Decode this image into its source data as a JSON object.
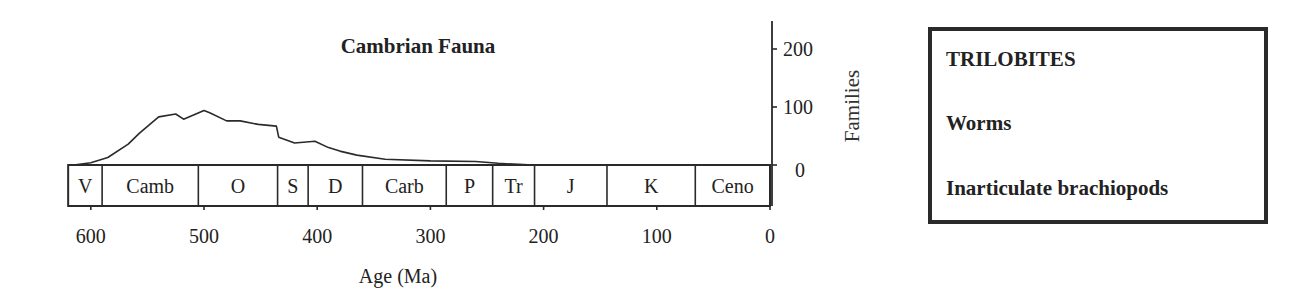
{
  "chart_data": {
    "type": "area",
    "title": "Cambrian Fauna",
    "xlabel": "Age  (Ma)",
    "ylabel": "Families",
    "xlim": [
      620,
      0
    ],
    "ylim": [
      0,
      250
    ],
    "x_ticks": [
      600,
      500,
      400,
      300,
      200,
      100,
      0
    ],
    "y_ticks": [
      0,
      100,
      200
    ],
    "grid": false,
    "y_axis_position": "right",
    "series": [
      {
        "name": "Cambrian Fauna",
        "x": [
          615,
          600,
          585,
          567,
          557,
          540,
          525,
          518,
          500,
          495,
          480,
          468,
          452,
          436,
          434,
          420,
          402,
          390,
          380,
          365,
          340,
          300,
          260,
          240,
          222,
          210
        ],
        "values": [
          0,
          4,
          13,
          36,
          55,
          83,
          88,
          79,
          94,
          90,
          76,
          76,
          70,
          67,
          48,
          38,
          41,
          30,
          24,
          17,
          10,
          7,
          6,
          3,
          1,
          0
        ]
      }
    ],
    "periods": [
      {
        "label": "V",
        "start": 620,
        "end": 590
      },
      {
        "label": "Camb",
        "start": 590,
        "end": 505
      },
      {
        "label": "O",
        "start": 505,
        "end": 435
      },
      {
        "label": "S",
        "start": 435,
        "end": 408
      },
      {
        "label": "D",
        "start": 408,
        "end": 360
      },
      {
        "label": "Carb",
        "start": 360,
        "end": 286
      },
      {
        "label": "P",
        "start": 286,
        "end": 245
      },
      {
        "label": "Tr",
        "start": 245,
        "end": 208
      },
      {
        "label": "J",
        "start": 208,
        "end": 144
      },
      {
        "label": "K",
        "start": 144,
        "end": 66
      },
      {
        "label": "Ceno",
        "start": 66,
        "end": 0
      }
    ],
    "legend": {
      "position": "right",
      "entries": [
        "TRILOBITES",
        "Worms",
        "Inarticulate brachiopods"
      ]
    }
  }
}
